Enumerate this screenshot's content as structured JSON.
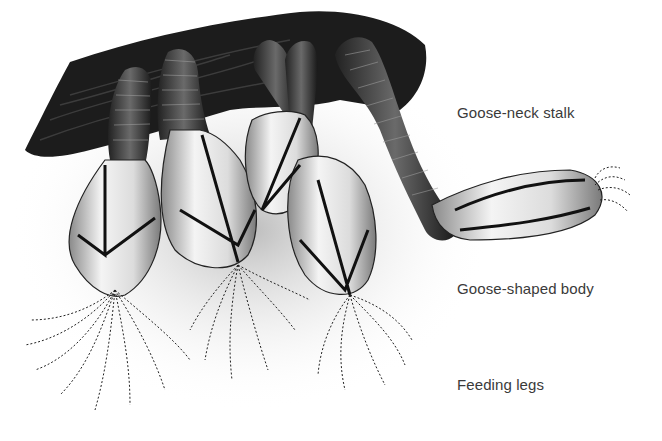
{
  "figure": {
    "labels": [
      {
        "id": "stalk",
        "text": "Goose-neck stalk",
        "x": 457,
        "y": 104
      },
      {
        "id": "body",
        "text": "Goose-shaped body",
        "x": 457,
        "y": 280
      },
      {
        "id": "legs",
        "text": "Feeding legs",
        "x": 457,
        "y": 376
      }
    ]
  }
}
